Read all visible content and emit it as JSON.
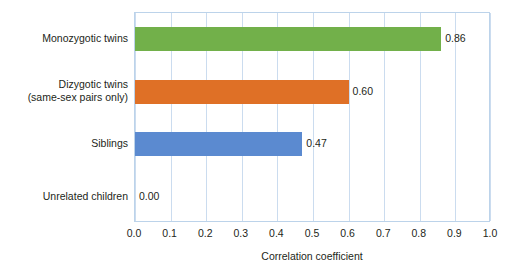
{
  "chart_data": {
    "type": "bar",
    "orientation": "horizontal",
    "title": "",
    "xlabel": "Correlation coefficient",
    "ylabel": "",
    "xlim": [
      0.0,
      1.0
    ],
    "grid": true,
    "legend": "none",
    "categories": [
      "Monozygotic twins",
      "Dizygotic twins\n(same-sex pairs only)",
      "Siblings",
      "Unrelated children"
    ],
    "values": [
      0.86,
      0.6,
      0.47,
      0.0
    ],
    "value_labels": [
      "0.86",
      "0.60",
      "0.47",
      "0.00"
    ],
    "bar_colors": [
      "#72b04a",
      "#df7026",
      "#5b8ad0",
      "#ffffff"
    ],
    "xticks": [
      0.0,
      0.1,
      0.2,
      0.3,
      0.4,
      0.5,
      0.6,
      0.7,
      0.8,
      0.9,
      1.0
    ],
    "xtick_labels": [
      "0.0",
      "0.1",
      "0.2",
      "0.3",
      "0.4",
      "0.5",
      "0.6",
      "0.7",
      "0.8",
      "0.9",
      "1.0"
    ],
    "gridline_color": "#cbdcef",
    "plot_border_color": "#bcd3ea",
    "background_color": "#ffffff",
    "text_color": "#231f20"
  }
}
